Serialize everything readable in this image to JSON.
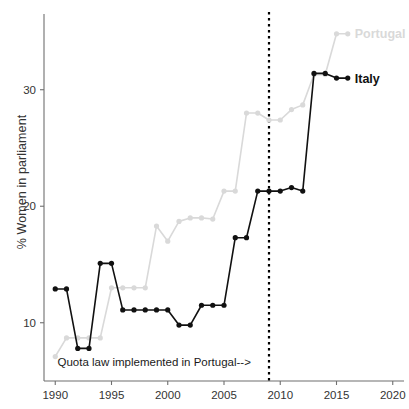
{
  "chart_data": {
    "type": "line",
    "title": "",
    "xlabel": "",
    "ylabel": "% Women in parliament",
    "xlim": [
      1989,
      2021
    ],
    "ylim": [
      5.0,
      36.5
    ],
    "xticks": [
      1990,
      1995,
      2000,
      2005,
      2010,
      2015,
      2020
    ],
    "xtick_labels": [
      "1990",
      "1995",
      "2000",
      "2005",
      "2010",
      "2015",
      "2020"
    ],
    "yticks": [
      10,
      20,
      30
    ],
    "ytick_labels": [
      "10",
      "20",
      "30"
    ],
    "grid": false,
    "legend_position": "inline-right-end-of-line",
    "series": [
      {
        "name": "Italy",
        "color": "#111111",
        "marker": "circle",
        "x": [
          1990,
          1991,
          1992,
          1993,
          1994,
          1995,
          1996,
          1997,
          1998,
          1999,
          2000,
          2001,
          2002,
          2003,
          2004,
          2005,
          2006,
          2007,
          2008,
          2009,
          2010,
          2011,
          2012,
          2013,
          2014,
          2015,
          2016
        ],
        "values": [
          12.9,
          12.9,
          7.8,
          7.8,
          15.1,
          15.1,
          11.1,
          11.1,
          11.1,
          11.1,
          11.1,
          9.8,
          9.8,
          11.5,
          11.5,
          11.5,
          17.3,
          17.3,
          21.3,
          21.3,
          21.3,
          21.6,
          21.3,
          31.4,
          31.4,
          31.0,
          31.0
        ]
      },
      {
        "name": "Portugal",
        "color": "#d9d9d9",
        "marker": "circle",
        "x": [
          1990,
          1991,
          1992,
          1993,
          1994,
          1995,
          1996,
          1997,
          1998,
          1999,
          2000,
          2001,
          2002,
          2003,
          2004,
          2005,
          2006,
          2007,
          2008,
          2009,
          2010,
          2011,
          2012,
          2013,
          2014,
          2015,
          2016
        ],
        "values": [
          7.1,
          8.7,
          8.7,
          8.7,
          8.7,
          13.0,
          13.0,
          13.0,
          13.0,
          18.3,
          17.0,
          18.7,
          19.0,
          19.0,
          18.9,
          21.3,
          21.3,
          28.0,
          28.0,
          27.4,
          27.4,
          28.3,
          28.7,
          31.3,
          31.3,
          34.8,
          34.8
        ]
      }
    ],
    "annotations": [
      {
        "name": "quota-law-note",
        "text": "Quota law implemented in Portugal-->",
        "x": 1990.2,
        "y": 6.3
      }
    ],
    "reference_lines": [
      {
        "name": "quota-law-line",
        "orientation": "vertical",
        "x": 2009,
        "style": "dotted",
        "color": "#000000"
      }
    ],
    "legend_labels": {
      "italy": "Italy",
      "portugal": "Portugal"
    },
    "colors": {
      "italy": "#111111",
      "portugal": "#d9d9d9",
      "axis": "#6f6f6f",
      "text": "#333333"
    }
  }
}
